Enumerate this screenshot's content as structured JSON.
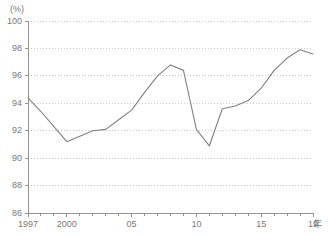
{
  "chart_data": {
    "type": "line",
    "title": "",
    "subtitle": "",
    "xlabel": "年",
    "ylabel": "",
    "unit_label": "(%)",
    "ylim": [
      86,
      100
    ],
    "y_ticks": [
      86,
      88,
      90,
      92,
      94,
      96,
      98,
      100
    ],
    "y_tick_labels": [
      "86",
      "88",
      "90",
      "92",
      "94",
      "96",
      "98",
      "100"
    ],
    "xlim": [
      1997,
      2019
    ],
    "x_ticks": [
      1997,
      2000,
      2005,
      2010,
      2015,
      2019
    ],
    "x_tick_labels": [
      "1997",
      "2000",
      "05",
      "10",
      "15",
      "19"
    ],
    "grid": "horizontal-dotted",
    "legend": "none",
    "line_color": "#808080",
    "grid_color": "#bdbdbd",
    "axis_color": "#8a8a8a",
    "x": [
      1997,
      1998,
      1999,
      2000,
      2001,
      2002,
      2003,
      2004,
      2005,
      2006,
      2007,
      2008,
      2009,
      2010,
      2011,
      2012,
      2013,
      2014,
      2015,
      2016,
      2017,
      2018,
      2019
    ],
    "values": [
      94.4,
      93.4,
      92.3,
      91.2,
      91.6,
      92.0,
      92.1,
      92.8,
      93.5,
      94.8,
      96.0,
      96.8,
      96.4,
      92.1,
      90.9,
      93.6,
      93.8,
      94.2,
      95.1,
      96.4,
      97.3,
      97.9,
      97.6
    ],
    "series": [
      {
        "name": "series-1",
        "values": [
          94.4,
          93.4,
          92.3,
          91.2,
          91.6,
          92.0,
          92.1,
          92.8,
          93.5,
          94.8,
          96.0,
          96.8,
          96.4,
          92.1,
          90.9,
          93.6,
          93.8,
          94.2,
          95.1,
          96.4,
          97.3,
          97.9,
          97.6
        ]
      }
    ],
    "annotations": []
  },
  "axes": {
    "y_unit": "(%)",
    "x_unit": "年"
  }
}
